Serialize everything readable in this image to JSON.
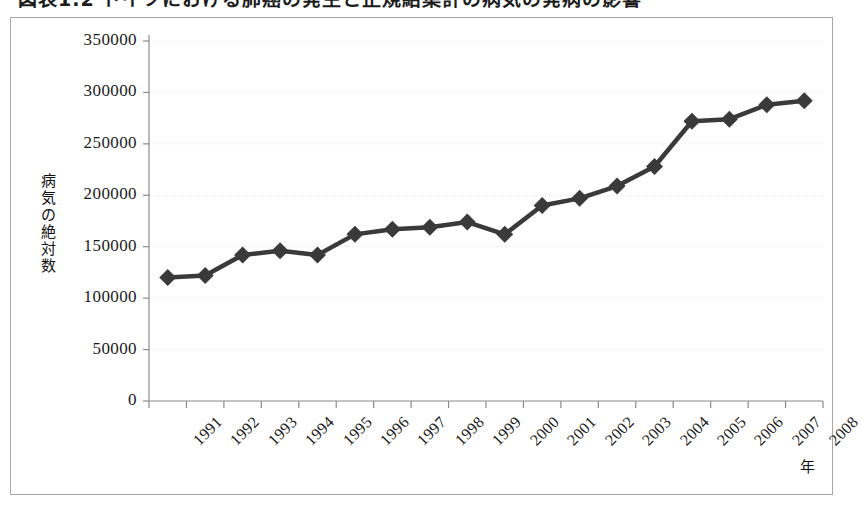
{
  "figure": {
    "title_clipped": "図表1.2 ドイツにおける肺癌の発生と正規給集計の病気の発病の影響",
    "title_note": "clipped"
  },
  "chart_data": {
    "type": "line",
    "title": "",
    "xlabel": "年",
    "ylabel": "病気の絶対数",
    "categories": [
      "1991",
      "1992",
      "1993",
      "1994",
      "1995",
      "1996",
      "1997",
      "1998",
      "1999",
      "2000",
      "2001",
      "2002",
      "2003",
      "2004",
      "2005",
      "2006",
      "2007",
      "2008"
    ],
    "values": [
      120000,
      122000,
      142000,
      146000,
      142000,
      162000,
      167000,
      169000,
      174000,
      162000,
      190000,
      197000,
      209000,
      228000,
      272000,
      274000,
      288000,
      292000
    ],
    "series": [
      {
        "name": "病気の絶対数",
        "values": [
          120000,
          122000,
          142000,
          146000,
          142000,
          162000,
          167000,
          169000,
          174000,
          162000,
          190000,
          197000,
          209000,
          228000,
          272000,
          274000,
          288000,
          292000
        ]
      }
    ],
    "ylim": [
      0,
      350000
    ],
    "yticks": [
      0,
      50000,
      100000,
      150000,
      200000,
      250000,
      300000,
      350000
    ],
    "ytick_labels": [
      "0",
      "50000",
      "100000",
      "150000",
      "200000",
      "250000",
      "300000",
      "350000"
    ],
    "grid": true,
    "grid_style": "dotted-horizontal",
    "legend": null,
    "marker": "diamond",
    "line_color": "#3a3a3a",
    "marker_color": "#3a3a3a",
    "axis_color": "#8a8a8a",
    "grid_color": "#d9d9d9",
    "xtick_rotation": -45
  }
}
